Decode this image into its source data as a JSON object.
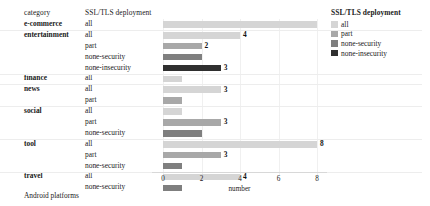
{
  "figure": {
    "header": {
      "category_label": "category",
      "series_label": "SSL/TLS deployment"
    },
    "caption": "Android platforms"
  },
  "legend": {
    "title": "SSL/TLS deployment",
    "items": [
      {
        "label": "all",
        "color": "#d5d5d5"
      },
      {
        "label": "part",
        "color": "#a8a8a8"
      },
      {
        "label": "none-security",
        "color": "#7f7f7f"
      },
      {
        "label": "none-insecurity",
        "color": "#2f2f2f"
      }
    ]
  },
  "axis": {
    "ticks": [
      "0",
      "2",
      "4",
      "6",
      "8"
    ],
    "xlabel": "number"
  },
  "chart_data": {
    "type": "bar",
    "orientation": "horizontal",
    "title": "",
    "xlabel": "number",
    "ylabel": "category",
    "xlim": [
      0,
      8.4
    ],
    "grid": true,
    "legend_position": "right",
    "legend_title": "SSL/TLS deployment",
    "group_field": "category",
    "series_field": "SSL/TLS deployment",
    "rows": [
      {
        "category": "e-commerce",
        "deployment": "all",
        "value": 8,
        "label": "",
        "color": "#d5d5d5",
        "group_start": true
      },
      {
        "category": "entertainment",
        "deployment": "all",
        "value": 4,
        "label": "4",
        "color": "#d5d5d5",
        "group_start": true
      },
      {
        "category": "",
        "deployment": "part",
        "value": 2,
        "label": "2",
        "color": "#a8a8a8",
        "group_start": false
      },
      {
        "category": "",
        "deployment": "none-security",
        "value": 2,
        "label": "",
        "color": "#7f7f7f",
        "group_start": false
      },
      {
        "category": "",
        "deployment": "none-insecurity",
        "value": 3,
        "label": "3",
        "color": "#2f2f2f",
        "group_start": false
      },
      {
        "category": "finance",
        "deployment": "all",
        "value": 1,
        "label": "",
        "color": "#d5d5d5",
        "group_start": true
      },
      {
        "category": "news",
        "deployment": "all",
        "value": 3,
        "label": "3",
        "color": "#d5d5d5",
        "group_start": true
      },
      {
        "category": "",
        "deployment": "part",
        "value": 1,
        "label": "",
        "color": "#a8a8a8",
        "group_start": false
      },
      {
        "category": "social",
        "deployment": "all",
        "value": 1,
        "label": "",
        "color": "#d5d5d5",
        "group_start": true
      },
      {
        "category": "",
        "deployment": "part",
        "value": 3,
        "label": "3",
        "color": "#a8a8a8",
        "group_start": false
      },
      {
        "category": "",
        "deployment": "none-security",
        "value": 2,
        "label": "",
        "color": "#7f7f7f",
        "group_start": false
      },
      {
        "category": "tool",
        "deployment": "all",
        "value": 8,
        "label": "8",
        "color": "#d5d5d5",
        "group_start": true
      },
      {
        "category": "",
        "deployment": "part",
        "value": 3,
        "label": "3",
        "color": "#a8a8a8",
        "group_start": false
      },
      {
        "category": "",
        "deployment": "none-security",
        "value": 1,
        "label": "",
        "color": "#7f7f7f",
        "group_start": false
      },
      {
        "category": "travel",
        "deployment": "all",
        "value": 4,
        "label": "4",
        "color": "#d5d5d5",
        "group_start": true
      },
      {
        "category": "",
        "deployment": "none-security",
        "value": 1,
        "label": "",
        "color": "#7f7f7f",
        "group_start": false
      }
    ]
  }
}
